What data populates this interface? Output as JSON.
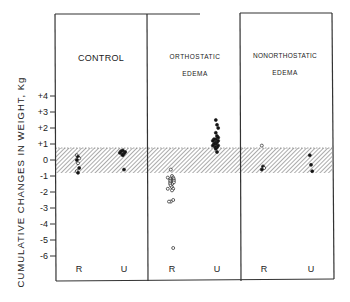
{
  "chart_data": {
    "type": "scatter",
    "title": "",
    "ylabel": "CUMULATIVE CHANGES IN WEIGHT, Kg",
    "xlabel": "",
    "ylim": [
      -7,
      6
    ],
    "yticks": [
      "+4",
      "+3",
      "+2",
      "+1",
      "0",
      "-1",
      "-2",
      "-3",
      "-4",
      "-5",
      "-6"
    ],
    "ytick_values": [
      4,
      3,
      2,
      1,
      0,
      -1,
      -2,
      -3,
      -4,
      -5,
      -6
    ],
    "normal_range_band": {
      "from": -0.8,
      "to": 0.7,
      "style": "hatched"
    },
    "panels": [
      {
        "title": "CONTROL",
        "subtitle": "",
        "categories": [
          "R",
          "U"
        ],
        "series": [
          {
            "name": "R",
            "marker": "mixed",
            "values": [
              0.3,
              0.2,
              0.1,
              0.0,
              -0.2,
              -0.5,
              -0.7,
              -0.8
            ]
          },
          {
            "name": "U",
            "marker": "filled",
            "values": [
              0.6,
              0.55,
              0.5,
              0.45,
              0.4,
              0.35,
              0.3,
              -0.6
            ]
          }
        ]
      },
      {
        "title": "ORTHOSTATIC",
        "subtitle": "EDEMA",
        "categories": [
          "R",
          "U"
        ],
        "series": [
          {
            "name": "R",
            "marker": "open",
            "values": [
              -0.6,
              -1.0,
              -1.1,
              -1.1,
              -1.2,
              -1.2,
              -1.2,
              -1.3,
              -1.3,
              -1.3,
              -1.4,
              -1.4,
              -1.4,
              -1.5,
              -1.5,
              -1.6,
              -1.7,
              -1.8,
              -1.8,
              -1.9,
              -2.5,
              -2.6,
              -2.6,
              -5.5
            ]
          },
          {
            "name": "U",
            "marker": "filled",
            "values": [
              2.5,
              2.2,
              2.0,
              1.7,
              1.5,
              1.4,
              1.3,
              1.3,
              1.2,
              1.2,
              1.1,
              1.1,
              1.0,
              1.0,
              0.9,
              0.9,
              0.8,
              0.8,
              0.7,
              0.5
            ]
          }
        ]
      },
      {
        "title": "NONORTHOSTATIC",
        "subtitle": "EDEMA",
        "categories": [
          "R",
          "U"
        ],
        "series": [
          {
            "name": "R",
            "marker": "mixed",
            "values": [
              0.9,
              -0.4,
              -0.5,
              -0.6
            ]
          },
          {
            "name": "U",
            "marker": "filled",
            "values": [
              0.3,
              -0.3,
              -0.7
            ]
          }
        ]
      }
    ]
  },
  "axis": {
    "ylabel": "CUMULATIVE CHANGES IN WEIGHT, Kg",
    "ticks": [
      "+4",
      "+3",
      "+2",
      "+1",
      "0",
      "-1",
      "-2",
      "-3",
      "-4",
      "-5",
      "-6"
    ]
  },
  "panels": [
    {
      "title": "CONTROL",
      "subtitle": "",
      "x_r": "R",
      "x_u": "U"
    },
    {
      "title": "ORTHOSTATIC",
      "subtitle": "EDEMA",
      "x_r": "R",
      "x_u": "U"
    },
    {
      "title": "NONORTHOSTATIC",
      "subtitle": "EDEMA",
      "x_r": "R",
      "x_u": "U"
    }
  ]
}
